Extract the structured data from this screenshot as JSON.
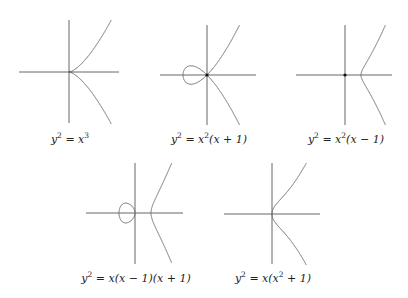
{
  "figure": {
    "panels": [
      {
        "id": "cusp",
        "equation": "y^2 = x^3",
        "label_parts": [
          "y",
          "2",
          " = ",
          "x",
          "3",
          ""
        ],
        "origin": [
          69,
          72
        ],
        "scale": 28,
        "x_axis": [
          19,
          119
        ],
        "y_axis": [
          20,
          123
        ],
        "node_dot": false,
        "label_pos": [
          70,
          139
        ]
      },
      {
        "id": "node",
        "equation": "y^2 = x^2(x+1)",
        "label_parts": [
          "y",
          "2",
          " = ",
          "x",
          "2",
          "(x + 1)"
        ],
        "origin": [
          207,
          75
        ],
        "scale": 24,
        "x_axis": [
          160,
          256
        ],
        "y_axis": [
          25,
          125
        ],
        "node_dot": true,
        "label_pos": [
          209,
          139
        ]
      },
      {
        "id": "isolated-point",
        "equation": "y^2 = x^2(x-1)",
        "label_parts": [
          "y",
          "2",
          " = ",
          "x",
          "2",
          "(x − 1)"
        ],
        "origin": [
          345,
          75
        ],
        "scale": 16,
        "x_axis": [
          296,
          392
        ],
        "y_axis": [
          25,
          125
        ],
        "node_dot": true,
        "label_pos": [
          346,
          139
        ]
      },
      {
        "id": "two-components",
        "equation": "y^2 = x(x-1)(x+1)",
        "label_parts": [
          "y",
          "2",
          " = ",
          "x(x − 1)(x + 1)",
          "",
          ""
        ],
        "origin": [
          135,
          213
        ],
        "scale": 16,
        "x_axis": [
          86,
          183
        ],
        "y_axis": [
          163,
          264
        ],
        "node_dot": false,
        "label_pos": [
          136,
          278
        ]
      },
      {
        "id": "smooth",
        "equation": "y^2 = x(x^2+1)",
        "label_parts": [
          "y",
          "2",
          " = ",
          "x(x",
          "2",
          " + 1)"
        ],
        "origin": [
          272,
          214
        ],
        "scale": 22,
        "x_axis": [
          224,
          320
        ],
        "y_axis": [
          163,
          264
        ],
        "node_dot": false,
        "label_pos": [
          273,
          278
        ]
      }
    ],
    "colors": {
      "axis": "#555555",
      "curve": "#6e6e6e",
      "background": "#ffffff"
    }
  }
}
